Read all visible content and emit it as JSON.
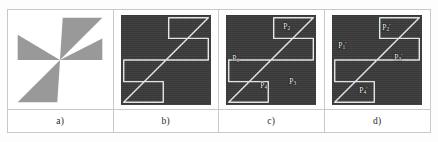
{
  "figure": {
    "panels": [
      {
        "id": "a",
        "caption": "a)",
        "kind": "filled-shape",
        "background": "#ffffff",
        "shape_fill": "#999999",
        "description": "filled gray pinwheel on white background"
      },
      {
        "id": "b",
        "caption": "b)",
        "kind": "contour",
        "background": "#3a3a3a",
        "contour_color": "#e8e8e8",
        "description": "extracted pinwheel contour outline on dark background",
        "labels": []
      },
      {
        "id": "c",
        "caption": "c)",
        "kind": "contour-labeled",
        "background": "#3a3a3a",
        "contour_color": "#e8e8e8",
        "description": "contour with detected corner points",
        "labels": [
          {
            "name": "P",
            "sub": "1",
            "sup": "",
            "x": 6,
            "y": 40
          },
          {
            "name": "P",
            "sub": "2",
            "sup": "",
            "x": 57,
            "y": 8
          },
          {
            "name": "P",
            "sub": "3",
            "sup": "",
            "x": 63,
            "y": 63
          },
          {
            "name": "P",
            "sub": "4",
            "sup": "",
            "x": 34,
            "y": 67
          }
        ]
      },
      {
        "id": "d",
        "caption": "d)",
        "kind": "contour-labeled",
        "background": "#3a3a3a",
        "contour_color": "#e8e8e8",
        "description": "contour with transformed corner points",
        "labels": [
          {
            "name": "P",
            "sub": "1",
            "sup": "'",
            "x": 6,
            "y": 27
          },
          {
            "name": "P",
            "sub": "2",
            "sup": "'",
            "x": 50,
            "y": 9
          },
          {
            "name": "P",
            "sub": "3",
            "sup": "'",
            "x": 62,
            "y": 39
          },
          {
            "name": "P",
            "sub": "4",
            "sup": "'",
            "x": 27,
            "y": 72
          }
        ]
      }
    ],
    "colors": {
      "page_background": "#ffffff",
      "grid_border": "#c9c9c9",
      "shape_gray": "#999999",
      "panel_dark": "#3a3a3a",
      "contour_light": "#e8e8e8",
      "caption_text": "#2a2a2a"
    }
  }
}
